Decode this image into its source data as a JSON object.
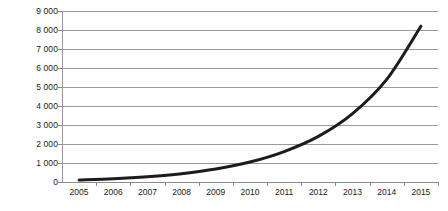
{
  "chart_data": {
    "type": "line",
    "title": "",
    "subtitle": "",
    "xlabel": "",
    "ylabel": "",
    "categories": [
      "2005",
      "2006",
      "2007",
      "2008",
      "2009",
      "2010",
      "2011",
      "2012",
      "2013",
      "2014",
      "2015"
    ],
    "x": [
      2005,
      2006,
      2007,
      2008,
      2009,
      2010,
      2011,
      2012,
      2013,
      2014,
      2015
    ],
    "series": [
      {
        "name": "",
        "values": [
          100,
          170,
          280,
          440,
          680,
          1050,
          1600,
          2400,
          3600,
          5400,
          8200
        ]
      }
    ],
    "values": [
      100,
      170,
      280,
      440,
      680,
      1050,
      1600,
      2400,
      3600,
      5400,
      8200
    ],
    "ylim": [
      0,
      9000
    ],
    "xlim": [
      2005,
      2015
    ],
    "y_ticks": [
      0,
      1000,
      2000,
      3000,
      4000,
      5000,
      6000,
      7000,
      8000,
      9000
    ],
    "y_tick_labels": [
      "0",
      "1 000",
      "2 000",
      "3 000",
      "4 000",
      "5 000",
      "6 000",
      "7 000",
      "8 000",
      "9 000"
    ],
    "grid": true,
    "legend": false,
    "legend_position": "none",
    "annotations": [],
    "colors": {
      "line": "#1c1c1c",
      "gridline": "#9a9a9a",
      "axis": "#8a8a8a",
      "background": "#ffffff",
      "text": "#1a1a1a"
    },
    "line_width_px": 3
  }
}
